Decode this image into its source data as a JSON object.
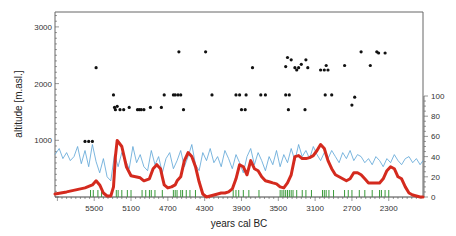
{
  "chart_data": {
    "type": "line",
    "title": "",
    "xlabel": "years cal BC",
    "ylabel": "altitude [m.asl.]",
    "y2label": "",
    "xlim": [
      5926,
      1928
    ],
    "ylim": [
      0,
      3200
    ],
    "y2lim": [
      0,
      100
    ],
    "x_ticks": [
      5500,
      5100,
      4700,
      4300,
      3900,
      3500,
      3100,
      2700,
      2300
    ],
    "y_ticks": [
      1000,
      2000,
      3000
    ],
    "y2_ticks": [
      0,
      20,
      40,
      60,
      80,
      100
    ],
    "grid": false,
    "legend": null,
    "colors": {
      "dots": "#111111",
      "blue": "#5ba3d6",
      "red": "#d42a1e",
      "green": "#3a9a3a",
      "axis": "#555555"
    },
    "series": [
      {
        "name": "site altitudes",
        "kind": "scatter",
        "axis": "left",
        "points": [
          [
            5600,
            980
          ],
          [
            5560,
            980
          ],
          [
            5520,
            980
          ],
          [
            5480,
            2280
          ],
          [
            5290,
            1800
          ],
          [
            5280,
            1580
          ],
          [
            5270,
            1540
          ],
          [
            5250,
            1600
          ],
          [
            5220,
            1540
          ],
          [
            5180,
            1540
          ],
          [
            5120,
            1580
          ],
          [
            5030,
            1540
          ],
          [
            5010,
            1540
          ],
          [
            4990,
            1540
          ],
          [
            4960,
            1540
          ],
          [
            4890,
            1580
          ],
          [
            4770,
            1580
          ],
          [
            4740,
            1800
          ],
          [
            4640,
            1800
          ],
          [
            4620,
            1800
          ],
          [
            4590,
            1800
          ],
          [
            4560,
            1800
          ],
          [
            4580,
            2560
          ],
          [
            4530,
            1540
          ],
          [
            4290,
            2560
          ],
          [
            4220,
            1800
          ],
          [
            3960,
            1800
          ],
          [
            3920,
            1800
          ],
          [
            3900,
            1540
          ],
          [
            3860,
            1540
          ],
          [
            3850,
            1800
          ],
          [
            3780,
            2280
          ],
          [
            3690,
            1800
          ],
          [
            3640,
            1800
          ],
          [
            3420,
            1800
          ],
          [
            3380,
            1800
          ],
          [
            3390,
            1540
          ],
          [
            3420,
            2300
          ],
          [
            3400,
            2460
          ],
          [
            3360,
            2420
          ],
          [
            3320,
            2280
          ],
          [
            3300,
            2240
          ],
          [
            3280,
            2280
          ],
          [
            3250,
            2340
          ],
          [
            3210,
            1540
          ],
          [
            3200,
            2420
          ],
          [
            3180,
            2280
          ],
          [
            3040,
            2240
          ],
          [
            3000,
            2240
          ],
          [
            2980,
            2320
          ],
          [
            2960,
            2240
          ],
          [
            2990,
            1800
          ],
          [
            2920,
            1800
          ],
          [
            2780,
            2320
          ],
          [
            2700,
            1620
          ],
          [
            2670,
            1760
          ],
          [
            2600,
            2560
          ],
          [
            2500,
            2320
          ],
          [
            2430,
            2560
          ],
          [
            2410,
            2540
          ],
          [
            2340,
            2540
          ]
        ]
      },
      {
        "name": "blue proxy",
        "kind": "line",
        "axis": "right",
        "x": [
          5926,
          5880,
          5840,
          5800,
          5760,
          5720,
          5680,
          5640,
          5600,
          5560,
          5520,
          5480,
          5440,
          5400,
          5360,
          5320,
          5280,
          5240,
          5200,
          5160,
          5120,
          5080,
          5040,
          5000,
          4960,
          4920,
          4880,
          4840,
          4800,
          4760,
          4720,
          4680,
          4640,
          4600,
          4560,
          4520,
          4480,
          4440,
          4400,
          4360,
          4320,
          4280,
          4240,
          4200,
          4160,
          4120,
          4080,
          4040,
          4000,
          3960,
          3920,
          3880,
          3840,
          3800,
          3760,
          3720,
          3680,
          3640,
          3600,
          3560,
          3520,
          3480,
          3440,
          3400,
          3360,
          3320,
          3280,
          3240,
          3200,
          3160,
          3120,
          3080,
          3040,
          3000,
          2960,
          2920,
          2880,
          2840,
          2800,
          2760,
          2720,
          2680,
          2640,
          2600,
          2560,
          2520,
          2480,
          2440,
          2400,
          2360,
          2320,
          2280,
          2240,
          2200,
          2160,
          2120,
          2080,
          2040,
          2000,
          1960,
          1928
        ],
        "values": [
          42,
          48,
          38,
          44,
          36,
          40,
          50,
          33,
          46,
          30,
          52,
          35,
          24,
          38,
          20,
          16,
          42,
          30,
          44,
          36,
          28,
          50,
          34,
          42,
          30,
          26,
          46,
          32,
          40,
          24,
          38,
          44,
          28,
          36,
          46,
          30,
          40,
          52,
          32,
          26,
          44,
          36,
          48,
          34,
          40,
          30,
          46,
          38,
          28,
          42,
          34,
          24,
          40,
          48,
          32,
          44,
          36,
          26,
          40,
          32,
          46,
          30,
          42,
          34,
          48,
          36,
          52,
          40,
          46,
          38,
          50,
          42,
          36,
          44,
          38,
          46,
          40,
          34,
          44,
          38,
          46,
          36,
          42,
          40,
          34,
          38,
          32,
          40,
          36,
          30,
          38,
          34,
          42,
          36,
          32,
          38,
          40,
          34,
          38,
          32,
          36
        ]
      },
      {
        "name": "red smoothed",
        "kind": "line",
        "axis": "right",
        "x": [
          5926,
          5800,
          5700,
          5600,
          5520,
          5480,
          5440,
          5400,
          5360,
          5320,
          5290,
          5270,
          5250,
          5200,
          5150,
          5100,
          5050,
          5000,
          4960,
          4900,
          4860,
          4820,
          4780,
          4760,
          4740,
          4700,
          4660,
          4620,
          4600,
          4560,
          4520,
          4480,
          4440,
          4400,
          4360,
          4320,
          4280,
          4240,
          4200,
          4160,
          4120,
          4080,
          4040,
          4000,
          3960,
          3920,
          3880,
          3840,
          3800,
          3760,
          3720,
          3680,
          3640,
          3600,
          3560,
          3520,
          3480,
          3440,
          3400,
          3360,
          3320,
          3280,
          3240,
          3200,
          3160,
          3120,
          3080,
          3040,
          3000,
          2960,
          2920,
          2880,
          2840,
          2800,
          2760,
          2720,
          2680,
          2640,
          2600,
          2560,
          2520,
          2480,
          2440,
          2400,
          2360,
          2320,
          2280,
          2240,
          2200,
          2160,
          2120,
          2080,
          2040,
          2000,
          1960,
          1928
        ],
        "values": [
          3,
          5,
          7,
          9,
          12,
          16,
          12,
          4,
          1,
          1,
          10,
          40,
          56,
          50,
          30,
          21,
          20,
          19,
          16,
          18,
          28,
          32,
          28,
          20,
          12,
          9,
          10,
          12,
          16,
          20,
          36,
          44,
          40,
          30,
          15,
          3,
          0,
          1,
          2,
          3,
          4,
          4,
          5,
          8,
          18,
          32,
          30,
          22,
          36,
          28,
          26,
          20,
          16,
          15,
          14,
          13,
          10,
          9,
          14,
          22,
          40,
          41,
          38,
          38,
          39,
          41,
          46,
          52,
          48,
          36,
          28,
          22,
          20,
          18,
          16,
          18,
          24,
          24,
          22,
          18,
          14,
          14,
          14,
          14,
          18,
          26,
          30,
          28,
          20,
          18,
          10,
          4,
          2,
          1,
          0,
          0
        ]
      },
      {
        "name": "green markers",
        "kind": "ticks",
        "axis": "bottom",
        "x": [
          5540,
          5510,
          5460,
          5420,
          5260,
          5240,
          5200,
          5140,
          5100,
          4980,
          4940,
          4900,
          4880,
          4840,
          4760,
          4640,
          4620,
          4600,
          4560,
          4540,
          4500,
          4460,
          4400,
          3990,
          3960,
          3930,
          3880,
          3820,
          3710,
          3480,
          3460,
          3440,
          3420,
          3400,
          3380,
          3360,
          3340,
          3300,
          3240,
          3200,
          3140,
          3020,
          3000,
          2980,
          2950,
          2900,
          2780,
          2740,
          2700,
          2620,
          2560,
          2480,
          2400,
          2380,
          2340,
          2300
        ]
      }
    ]
  }
}
